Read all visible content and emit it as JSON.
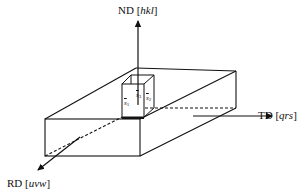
{
  "diagram": {
    "type": "3d-sample-coordinate-system",
    "axes": [
      {
        "id": "nd",
        "name": "ND",
        "indices": "hkl",
        "direction": "up"
      },
      {
        "id": "td",
        "name": "TD",
        "indices": "qrs",
        "direction": "right"
      },
      {
        "id": "rd",
        "name": "RD",
        "indices": "uvw",
        "direction": "down-left"
      }
    ],
    "cube_vectors": [
      {
        "id": "s1",
        "symbol": "s",
        "subscript": "1"
      },
      {
        "id": "s2",
        "symbol": "s",
        "subscript": "2"
      },
      {
        "id": "s3",
        "symbol": "s",
        "subscript": "3"
      }
    ]
  },
  "labels": {
    "nd_name": "ND",
    "nd_open": "[",
    "nd_idx": "hkl",
    "nd_close": "]",
    "td_name": "TD",
    "td_open": "[",
    "td_idx": "qrs",
    "td_close": "]",
    "rd_name": "RD",
    "rd_open": "[",
    "rd_idx": "uvw",
    "rd_close": "]",
    "s_sym": "s",
    "s1_sub": "1",
    "s2_sub": "2",
    "s3_sub": "3"
  },
  "colors": {
    "stroke": "#111111",
    "background": "#ffffff"
  }
}
